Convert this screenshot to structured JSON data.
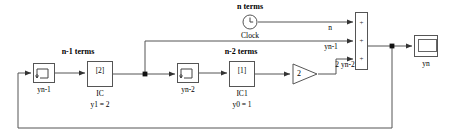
{
  "diagram": {
    "type": "simulink-block-diagram",
    "canvas": {
      "width": 451,
      "height": 136,
      "background": "#ffffff"
    },
    "colors": {
      "wire": "#555555",
      "block_border": "#666666",
      "text": "#000000",
      "background": "#ffffff"
    }
  },
  "annotations": {
    "n_minus_1_terms": "n-1 terms",
    "n_minus_2_terms": "n-2 terms",
    "n_terms": "n terms"
  },
  "blocks": {
    "delay1": {
      "name": "yn-1",
      "label": "yn-1",
      "kind": "unit-delay",
      "icon": "step-delay-icon",
      "x": 33,
      "y": 63,
      "w": 22,
      "h": 20
    },
    "ic1": {
      "name": "IC",
      "label": "IC",
      "sublabel": "y1 = 2",
      "value": "[2]",
      "kind": "initial-condition",
      "x": 87,
      "y": 61,
      "w": 26,
      "h": 26
    },
    "delay2": {
      "name": "yn-2",
      "label": "yn-2",
      "kind": "unit-delay",
      "icon": "step-delay-icon",
      "x": 177,
      "y": 63,
      "w": 22,
      "h": 20
    },
    "ic0": {
      "name": "IC1",
      "label": "IC1",
      "sublabel": "y0 = 1",
      "value": "[1]",
      "kind": "initial-condition",
      "x": 229,
      "y": 61,
      "w": 26,
      "h": 26
    },
    "gain": {
      "name": "gain",
      "value": "2",
      "kind": "gain",
      "x": 292,
      "y": 63,
      "w": 26,
      "h": 22
    },
    "clock": {
      "name": "Clock",
      "label": "Clock",
      "kind": "clock",
      "cx": 250,
      "cy": 22,
      "r": 8
    },
    "sum": {
      "name": "Sum",
      "kind": "sum",
      "signs": [
        "+",
        "+",
        "+"
      ],
      "x": 355,
      "y": 12,
      "w": 13,
      "h": 58
    },
    "scope": {
      "name": "Scope",
      "label": "yn",
      "kind": "scope",
      "x": 414,
      "y": 35,
      "w": 24,
      "h": 22
    }
  },
  "signal_labels": {
    "clock_out": "n",
    "feedback_yn1": "yn-1",
    "gain_out": "2 yn-2"
  }
}
